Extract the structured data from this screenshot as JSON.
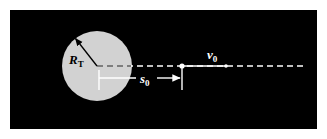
{
  "figure": {
    "panel": {
      "background_color": "#000000",
      "page_background_color": "#ffffff",
      "x": 10,
      "y": 10,
      "width": 307,
      "height": 119
    },
    "planet": {
      "name": "planet-body",
      "fill_color": "#d2d2d2",
      "center_x": 97,
      "center_y": 66,
      "radius": 35
    },
    "labels": {
      "radius": {
        "symbol": "R",
        "subscript": "T",
        "full": "R_T",
        "x": 69,
        "y": 62,
        "color": "#000000",
        "font_size": 13
      },
      "distance": {
        "symbol": "s",
        "subscript": "0",
        "full": "s_0",
        "x": 142,
        "y": 84,
        "color": "#ffffff",
        "font_size": 13
      },
      "velocity": {
        "symbol": "v",
        "subscript": "0",
        "full": "v_0",
        "x": 208,
        "y": 57,
        "color": "#ffffff",
        "font_size": 13
      }
    },
    "trajectory_line": {
      "name": "trajectory-axis",
      "style": "dashed",
      "color": "#ffffff",
      "y": 66,
      "x_start": 97,
      "x_end": 306,
      "dash": "6 4"
    },
    "velocity_segment": {
      "name": "velocity-solid-segment",
      "style": "solid",
      "color": "#ffffff",
      "y": 66,
      "x_start": 182,
      "x_end": 226
    },
    "particle": {
      "name": "point-mass",
      "color": "#ffffff",
      "x": 182,
      "y": 66,
      "radius": 2.5
    },
    "radius_arrow": {
      "name": "radius-indicator",
      "color": "#000000",
      "x_start": 97,
      "y_start": 66,
      "x_end": 74,
      "y_end": 37
    },
    "distance_measure": {
      "name": "s0-measurement",
      "color": "#ffffff",
      "y": 78,
      "x_start": 99,
      "x_end": 182,
      "tick_left_x": 99,
      "tick_left_top": 70,
      "tick_left_bottom": 90,
      "tick_right_x": 182,
      "tick_right_top": 68,
      "tick_right_bottom": 90
    }
  }
}
